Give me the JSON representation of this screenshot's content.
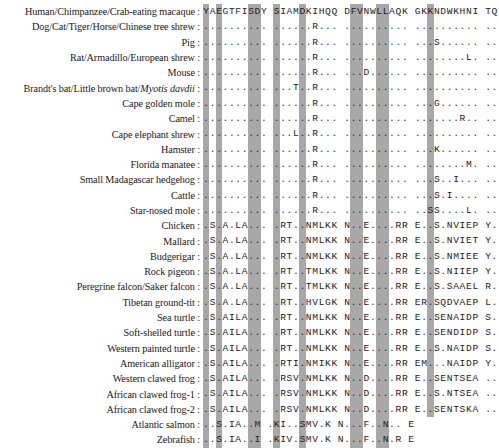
{
  "figure": {
    "name": "multiple-sequence-alignment",
    "label_separator": ":",
    "highlight_color": "#a8a8a8",
    "text_color": "#1d1d1d",
    "background_color": "#ffffff",
    "identity_symbol": ".",
    "columns": 42,
    "block_size": 10,
    "highlighted_columns": [
      1,
      3,
      8,
      9,
      11,
      15,
      22,
      23,
      26,
      27,
      33
    ],
    "reference_row_index": 0
  },
  "rows": [
    {
      "species": "Human/Chimpanzee/Crab-eating macaque",
      "italic_part": "",
      "sequence": "YAEGTFISDY SIAMDKIHQQ DFVNWLLAQK GKKNDWKHNI TQ"
    },
    {
      "species": "Dog/Cat/Tiger/Horse/Chinese tree shrew",
      "italic_part": "",
      "sequence": ".......... ......R... .......... .......... .."
    },
    {
      "species": "Pig",
      "italic_part": "",
      "sequence": ".......... ......R... .......... ...S...... .."
    },
    {
      "species": "Rat/Armadillo/European shrew",
      "italic_part": "",
      "sequence": ".......... ......R... .......... ........L. .."
    },
    {
      "species": "Mouse",
      "italic_part": "",
      "sequence": ".......... ......R... ...D...... .......... .."
    },
    {
      "species": "Brandt's bat/Little brown bat/",
      "italic_part": "Myotis davdii",
      "sequence": ".......... ...T..R... .......... .......... .."
    },
    {
      "species": "Cape golden mole",
      "italic_part": "",
      "sequence": ".......... ......R... .......... ...G...... .."
    },
    {
      "species": "Camel",
      "italic_part": "",
      "sequence": ".......... ......R... .......... .......R.. .."
    },
    {
      "species": "Cape elephant shrew",
      "italic_part": "",
      "sequence": ".......... ...L..R... .......... .......... .."
    },
    {
      "species": "Hamster",
      "italic_part": "",
      "sequence": ".......... ......R... .......... ...K...... .."
    },
    {
      "species": "Florida manatee",
      "italic_part": "",
      "sequence": ".......... ......R... .......... ........M. .."
    },
    {
      "species": "Small Madagascar hedgehog",
      "italic_part": "",
      "sequence": ".......... ......R... .......... ...S..I... .."
    },
    {
      "species": "Cattle",
      "italic_part": "",
      "sequence": ".......... ......R... .......... ...S.I.... .."
    },
    {
      "species": "Star-nosed mole",
      "italic_part": "",
      "sequence": ".......... ......R... .......... ..SS....L. .."
    },
    {
      "species": "Chicken",
      "italic_part": "",
      "sequence": ".S.A.LA... .RT..NMLKK N..E....RR E..S.NVIEP Y."
    },
    {
      "species": "Mallard",
      "italic_part": "",
      "sequence": ".S.A.LA... .RT..NMLKK N..E....RR E..S.NVIET Y."
    },
    {
      "species": "Budgerigar",
      "italic_part": "",
      "sequence": ".S.A.LA... .RT..NMLKK N..E....RR E..S.NMIEE Y."
    },
    {
      "species": "Rock  pigeon",
      "italic_part": "",
      "sequence": ".S.A.LA... .RT..TMLKK N..E....RR E..S.NIIEP Y."
    },
    {
      "species": "Peregrine falcon/Saker falcon",
      "italic_part": "",
      "sequence": ".S.A.LA... .RT..TMLKK N..E....RR E..S.SAAEL R."
    },
    {
      "species": "Tibetan ground-tit",
      "italic_part": "",
      "sequence": ".S.A.LA... .RT..HVLGK N..E....RR ER.SQDVAEP L."
    },
    {
      "species": "Sea turtle",
      "italic_part": "",
      "sequence": ".S.AILA... .RT..NMLKK N..E....RR E..SENAIDP S."
    },
    {
      "species": "Soft-shelled turtle",
      "italic_part": "",
      "sequence": ".S.AILA... .RT..NMLKK N..E....RR E..SENDIDP S."
    },
    {
      "species": "Western painted turtle",
      "italic_part": "",
      "sequence": ".S.AILA... .RT..NMLKK N..E....RR E..S.NAIDP S."
    },
    {
      "species": "American alligator",
      "italic_part": "",
      "sequence": ".S.AILA... .RTI.NMIKK N..E....RR EM...NAIDP Y."
    },
    {
      "species": "Western clawed frog",
      "italic_part": "",
      "sequence": ".S.AILA... .RSV.NMLKK N..D....RR E..SENTSEA .."
    },
    {
      "species": "African clawed frog-1",
      "italic_part": "",
      "sequence": ".S.AILA... .RSV.NMLKK N..D....RR E..S.NTSEA .."
    },
    {
      "species": "African clawed frog-2",
      "italic_part": "",
      "sequence": ".S.AILA... .RSV.NMLKK N..D....RR E..SENTSKA .."
    },
    {
      "species": "Atlantic salmon",
      "italic_part": "",
      "sequence": "..S.IA..M .KI..SMV.K N...F..N.. E"
    },
    {
      "species": "Zebrafish",
      "italic_part": "",
      "sequence": "..S.IA..I .KIV.SMV.K N...F..N.R E"
    }
  ]
}
